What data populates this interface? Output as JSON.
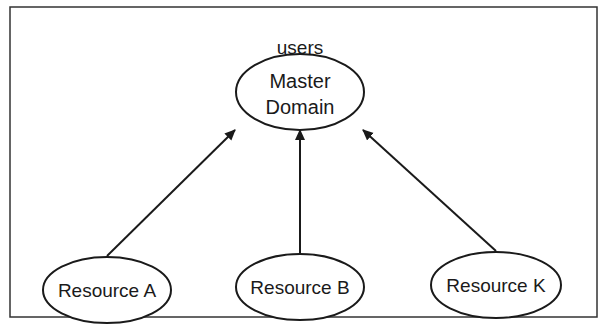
{
  "diagram": {
    "top_label": "users",
    "master": {
      "line1": "Master",
      "line2": "Domain"
    },
    "resources": [
      {
        "label": "Resource A"
      },
      {
        "label": "Resource B"
      },
      {
        "label": "Resource K"
      }
    ],
    "colors": {
      "stroke": "#1a1a1a",
      "background": "#ffffff",
      "frame": "#333333"
    }
  }
}
